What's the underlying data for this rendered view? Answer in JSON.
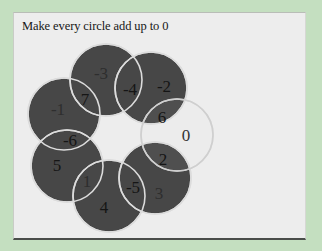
{
  "title": "Make every circle add up to 0",
  "colors": {
    "background": "#c4dfc0",
    "panel": "#ededed",
    "filled_circle": "#474747",
    "empty_circle": "#ededed",
    "circle_outline": "#d8d8d8",
    "dark_label": "#151515",
    "dim_label": "#2e2e2e"
  },
  "circles": [
    {
      "id": "top",
      "label": "-3",
      "filled": true
    },
    {
      "id": "upper-right",
      "label": "-2",
      "filled": true
    },
    {
      "id": "right",
      "label": "0",
      "filled": false
    },
    {
      "id": "lower-right",
      "label": "3",
      "filled": true
    },
    {
      "id": "bottom",
      "label": "4",
      "filled": true
    },
    {
      "id": "lower-left",
      "label": "5",
      "filled": true
    },
    {
      "id": "left",
      "label": "-1",
      "filled": true
    }
  ],
  "intersections": [
    {
      "between": "top/left",
      "label": "7"
    },
    {
      "between": "top/upper-right",
      "label": "-4"
    },
    {
      "between": "upper-right/right",
      "label": "6"
    },
    {
      "between": "right/lower-right",
      "label": "2"
    },
    {
      "between": "lower-right/bottom",
      "label": "-5"
    },
    {
      "between": "bottom/lower-left",
      "label": "1"
    },
    {
      "between": "lower-left/left",
      "label": "-6"
    }
  ]
}
